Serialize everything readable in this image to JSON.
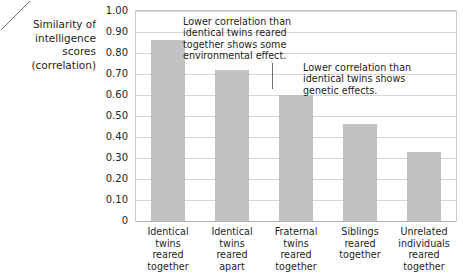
{
  "chart_data": {
    "type": "bar",
    "title": "",
    "xlabel": "",
    "ylabel": "Similarity of\nintelligence\nscores\n(correlation)",
    "ylim": [
      0,
      1.0
    ],
    "grid": true,
    "legend_position": "none",
    "categories": [
      "Identical\ntwins\nreared\ntogether",
      "Identical\ntwins\nreared\napart",
      "Fraternal\ntwins\nreared\ntogether",
      "Siblings\nreared\ntogether",
      "Unrelated\nindividuals\nreared\ntogether"
    ],
    "values": [
      0.86,
      0.72,
      0.6,
      0.46,
      0.33
    ],
    "ytick_labels": [
      "1.00",
      "0.90",
      "0.80",
      "0.70",
      "0.60",
      "0.50",
      "0.40",
      "0.30",
      "0.20",
      "0.10",
      "0"
    ],
    "ytick_values": [
      1.0,
      0.9,
      0.8,
      0.7,
      0.6,
      0.5,
      0.4,
      0.3,
      0.2,
      0.1,
      0
    ],
    "bar_color": "#c2c2c2",
    "gridline_color": "#d6d6d6",
    "frame_color": "#c9c9c9",
    "text_color": "#231f20",
    "annotations": [
      {
        "text": "Lower correlation than\nidentical twins reared\ntogether shows some\nenvironmental effect.",
        "points_to_category": "Identical twins reared apart"
      },
      {
        "text": "Lower correlation than\nidentical twins shows\ngenetic effects.",
        "points_to_category": "Fraternal twins reared together"
      }
    ]
  }
}
